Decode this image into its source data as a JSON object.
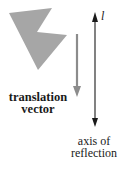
{
  "diagram": {
    "labels": {
      "axis_name": "l",
      "translation_line1": "translation",
      "translation_line2": "vector",
      "axis_line1": "axis of",
      "axis_line2": "reflection"
    },
    "colors": {
      "shape_fill": "#a6a6a6",
      "translation_vector": "#8c8c8c",
      "axis": "#1a1a1a",
      "background": "#ffffff"
    }
  }
}
